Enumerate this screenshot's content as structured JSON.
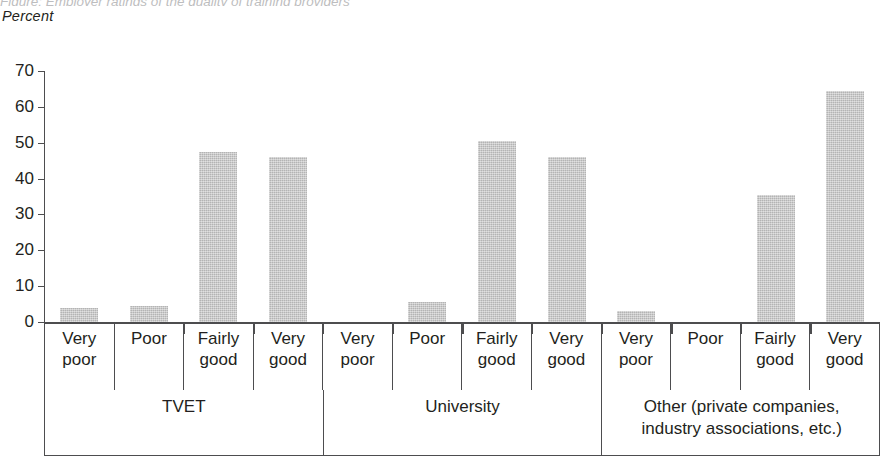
{
  "figure": {
    "cut_title": "Figure: Employer ratings of the quality of training providers",
    "unit_label": "Percent"
  },
  "chart_data": {
    "type": "bar",
    "title": "Percent",
    "xlabel": "",
    "ylabel": "Percent",
    "ylim": [
      0,
      70
    ],
    "yticks": [
      0,
      10,
      20,
      30,
      40,
      50,
      60,
      70
    ],
    "ytick_labels": [
      "0",
      "10",
      "20",
      "30",
      "40",
      "50",
      "60",
      "70"
    ],
    "grid": false,
    "legend": "none",
    "bar_color": "#c6c6c6",
    "categories": [
      "Very\npoor",
      "Poor",
      "Fairly\ngood",
      "Very\ngood",
      "Very\npoor",
      "Poor",
      "Fairly\ngood",
      "Very\ngood",
      "Very\npoor",
      "Poor",
      "Fairly\ngood",
      "Very\ngood"
    ],
    "values": [
      4,
      4.5,
      47.5,
      46,
      0,
      5.5,
      50.5,
      46,
      3,
      0,
      35.5,
      64.5
    ],
    "groups": [
      {
        "label": "TVET",
        "span": 4,
        "categories": [
          "Very poor",
          "Poor",
          "Fairly good",
          "Very good"
        ],
        "values": [
          4,
          4.5,
          47.5,
          46
        ]
      },
      {
        "label": "University",
        "span": 4,
        "categories": [
          "Very poor",
          "Poor",
          "Fairly good",
          "Very good"
        ],
        "values": [
          0,
          5.5,
          50.5,
          46
        ]
      },
      {
        "label": "Other (private companies,\nindustry associations, etc.)",
        "span": 4,
        "categories": [
          "Very poor",
          "Poor",
          "Fairly good",
          "Very good"
        ],
        "values": [
          3,
          0,
          35.5,
          64.5
        ]
      }
    ]
  }
}
